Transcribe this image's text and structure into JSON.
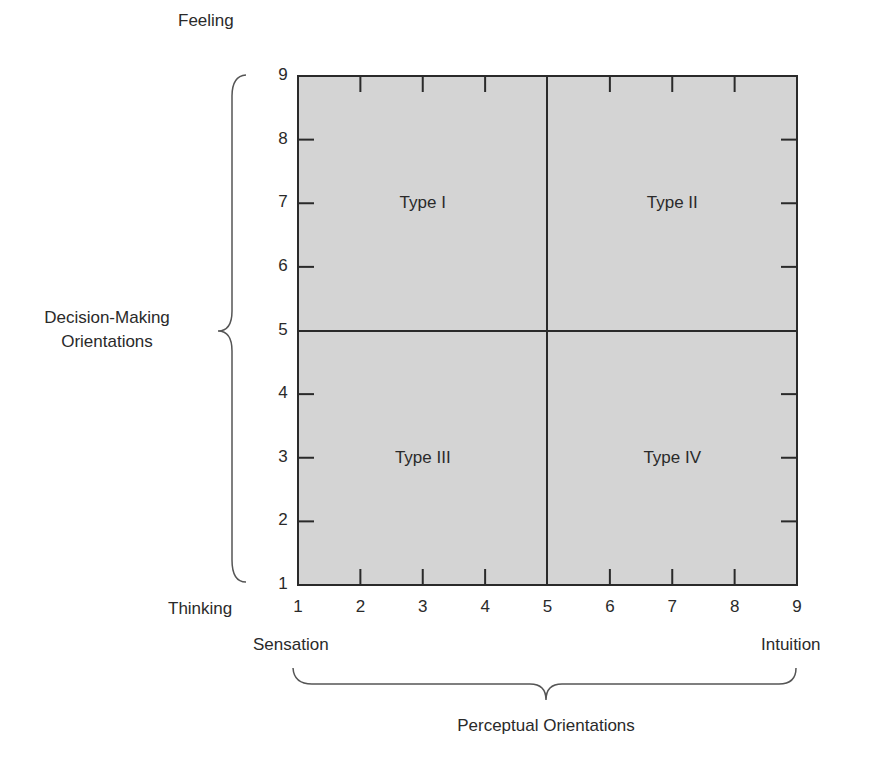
{
  "chart_data": {
    "type": "quadrant",
    "title": "",
    "xlabel": "Perceptual Orientations",
    "ylabel": "Decision-Making Orientations",
    "x_ticks": [
      "1",
      "2",
      "3",
      "4",
      "5",
      "6",
      "7",
      "8",
      "9"
    ],
    "y_ticks": [
      "1",
      "2",
      "3",
      "4",
      "5",
      "6",
      "7",
      "8",
      "9"
    ],
    "xlim": [
      1,
      9
    ],
    "ylim": [
      1,
      9
    ],
    "x_divider": 5,
    "y_divider": 5,
    "x_min_label": "Sensation",
    "x_max_label": "Intuition",
    "y_min_label": "Thinking",
    "y_max_label": "Feeling",
    "quadrants": [
      {
        "label": "Type I",
        "x": 3,
        "y": 7
      },
      {
        "label": "Type II",
        "x": 7,
        "y": 7
      },
      {
        "label": "Type III",
        "x": 3,
        "y": 3
      },
      {
        "label": "Type IV",
        "x": 7,
        "y": 3
      }
    ],
    "fill_color": "#d4d4d4",
    "line_color": "#2a2a2a"
  },
  "labels": {
    "feeling": "Feeling",
    "thinking": "Thinking",
    "sensation": "Sensation",
    "intuition": "Intuition",
    "decision_line1": "Decision-Making",
    "decision_line2": "Orientations",
    "perceptual": "Perceptual Orientations"
  }
}
